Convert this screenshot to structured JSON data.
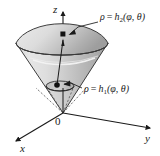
{
  "figure": {
    "title": "",
    "axes": {
      "z": "z",
      "y": "y",
      "x": "x",
      "origin": "0"
    },
    "labels": {
      "upper": {
        "rho": "ρ",
        "equals": "=",
        "func": "h",
        "sub": "2",
        "args": "(φ, θ)",
        "full": "ρ = h₂(φ, θ)"
      },
      "lower": {
        "rho": "ρ",
        "equals": "=",
        "func": "h",
        "sub": "1",
        "args": "(φ, θ)",
        "full": "ρ = h₁(φ, θ)"
      }
    },
    "colors": {
      "stroke": "#1a1a1a",
      "surface_light": "#e3e3e3",
      "surface_mid": "#c9c9c9",
      "surface_dark": "#a6a6a6",
      "dome_light": "#e8e8e8",
      "dome_dark": "#b4b4b4",
      "highlight": "#f4f4f4",
      "dashed": "#555555"
    },
    "geometry": {
      "origin_x": 63,
      "origin_y": 113,
      "rim_cx": 62,
      "rim_cy": 43,
      "rim_rx": 46,
      "rim_ry": 12,
      "dome_top_y": 17,
      "inner_rx": 13,
      "inner_ry": 4,
      "inner_cy": 86
    },
    "points": [
      {
        "name": "outer-point",
        "x": 63,
        "y": 35
      },
      {
        "name": "inner-point",
        "x": 57,
        "y": 85
      }
    ]
  }
}
